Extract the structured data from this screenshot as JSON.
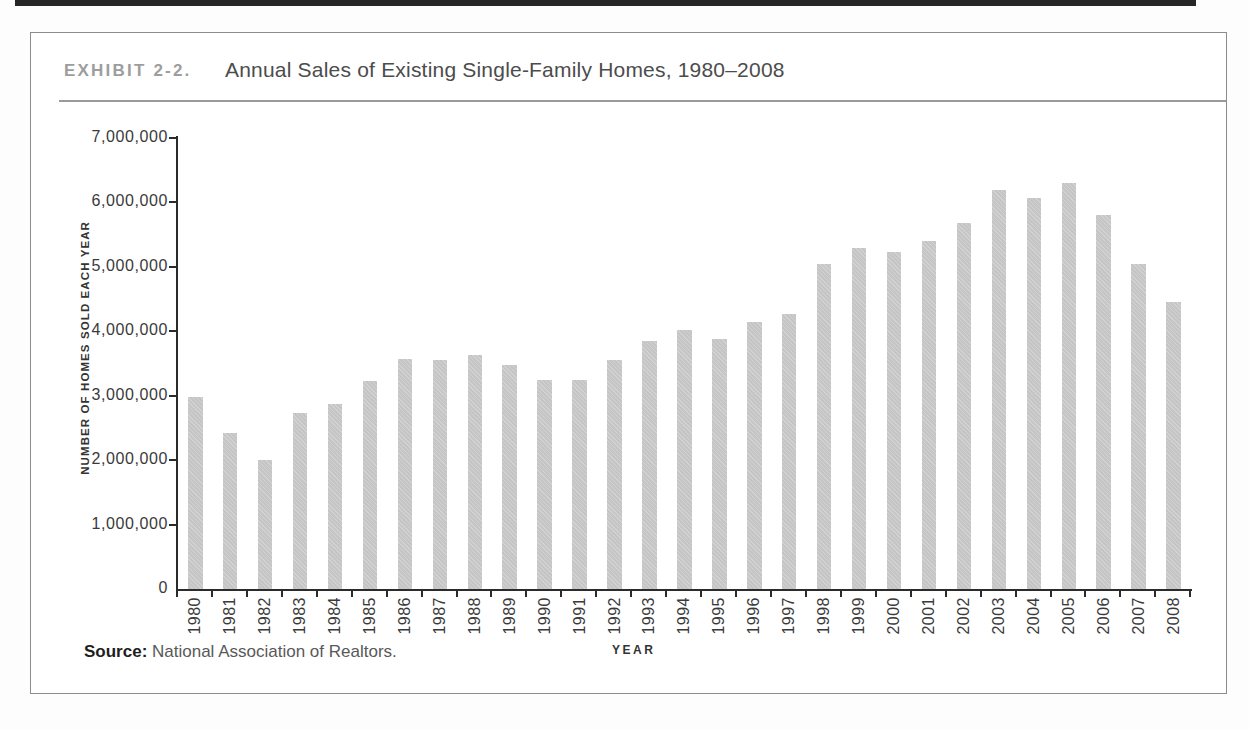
{
  "header": {
    "exhibit_label": "EXHIBIT 2-2.",
    "title": "Annual Sales of Existing Single-Family Homes, 1980–2008"
  },
  "source": {
    "label": "Source:",
    "text": " National Association of Realtors."
  },
  "chart_data": {
    "type": "bar",
    "title": "Annual Sales of Existing Single-Family Homes, 1980–2008",
    "xlabel": "YEAR",
    "ylabel": "NUMBER OF HOMES SOLD EACH YEAR",
    "ylim": [
      0,
      7000000
    ],
    "ytick_interval": 1000000,
    "ytick_labels": [
      "0",
      "1,000,000",
      "2,000,000",
      "3,000,000",
      "4,000,000",
      "5,000,000",
      "6,000,000",
      "7,000,000"
    ],
    "grid": false,
    "legend_position": "none",
    "bar_color": "#c9c9c9",
    "categories": [
      "1980",
      "1981",
      "1982",
      "1983",
      "1984",
      "1985",
      "1986",
      "1987",
      "1988",
      "1989",
      "1990",
      "1991",
      "1992",
      "1993",
      "1994",
      "1995",
      "1996",
      "1997",
      "1998",
      "1999",
      "2000",
      "2001",
      "2002",
      "2003",
      "2004",
      "2005",
      "2006",
      "2007",
      "2008"
    ],
    "values": [
      2975000,
      2425000,
      2000000,
      2725000,
      2875000,
      3225000,
      3575000,
      3550000,
      3625000,
      3475000,
      3240000,
      3250000,
      3550000,
      3850000,
      4025000,
      3875000,
      4150000,
      4275000,
      5050000,
      5300000,
      5225000,
      5400000,
      5675000,
      6200000,
      6075000,
      6300000,
      5800000,
      5050000,
      4450000
    ]
  }
}
